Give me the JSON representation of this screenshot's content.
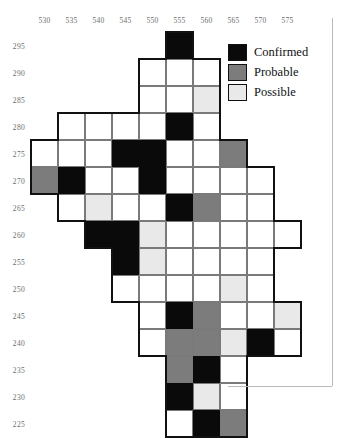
{
  "figure": {
    "type": "case-map-grid",
    "x_axis": {
      "label": "",
      "ticks": [
        530,
        535,
        540,
        545,
        550,
        555,
        560,
        565,
        570,
        575
      ]
    },
    "y_axis": {
      "label": "",
      "ticks": [
        295,
        290,
        285,
        280,
        275,
        270,
        265,
        260,
        255,
        250,
        245,
        240,
        235,
        230,
        225
      ]
    }
  },
  "legend": {
    "position": "top-right",
    "items": [
      {
        "key": "confirmed",
        "label": "Confirmed",
        "color": "#0a0a0a"
      },
      {
        "key": "probable",
        "label": "Probable",
        "color": "#7c7c7c"
      },
      {
        "key": "possible",
        "label": "Possible",
        "color": "#e9e9e9"
      }
    ]
  },
  "chart_data": {
    "type": "heatmap",
    "title": "",
    "xlabel": "",
    "ylabel": "",
    "categories_x": [
      530,
      535,
      540,
      545,
      550,
      555,
      560,
      565,
      570,
      575
    ],
    "categories_y": [
      295,
      290,
      285,
      280,
      275,
      270,
      265,
      260,
      255,
      250,
      245,
      240,
      235,
      230,
      225
    ],
    "value_levels": [
      "none",
      "possible",
      "probable",
      "confirmed"
    ],
    "level_colors": {
      "none": "#ffffff",
      "possible": "#e9e9e9",
      "probable": "#7c7c7c",
      "confirmed": "#0a0a0a"
    },
    "grid": true,
    "legend_position": "top-right",
    "rows": [
      {
        "y": 295,
        "cells": [
          {
            "x": 555,
            "v": "confirmed"
          }
        ]
      },
      {
        "y": 290,
        "cells": [
          {
            "x": 550,
            "v": "none"
          },
          {
            "x": 555,
            "v": "none"
          },
          {
            "x": 560,
            "v": "none"
          }
        ]
      },
      {
        "y": 285,
        "cells": [
          {
            "x": 550,
            "v": "none"
          },
          {
            "x": 555,
            "v": "none"
          },
          {
            "x": 560,
            "v": "possible"
          }
        ]
      },
      {
        "y": 280,
        "cells": [
          {
            "x": 535,
            "v": "none"
          },
          {
            "x": 540,
            "v": "none"
          },
          {
            "x": 545,
            "v": "none"
          },
          {
            "x": 550,
            "v": "none"
          },
          {
            "x": 555,
            "v": "confirmed"
          },
          {
            "x": 560,
            "v": "none"
          }
        ]
      },
      {
        "y": 275,
        "cells": [
          {
            "x": 530,
            "v": "none"
          },
          {
            "x": 535,
            "v": "none"
          },
          {
            "x": 540,
            "v": "none"
          },
          {
            "x": 545,
            "v": "confirmed"
          },
          {
            "x": 550,
            "v": "confirmed"
          },
          {
            "x": 555,
            "v": "none"
          },
          {
            "x": 560,
            "v": "none"
          },
          {
            "x": 565,
            "v": "probable"
          }
        ]
      },
      {
        "y": 270,
        "cells": [
          {
            "x": 530,
            "v": "probable"
          },
          {
            "x": 535,
            "v": "confirmed"
          },
          {
            "x": 540,
            "v": "none"
          },
          {
            "x": 545,
            "v": "none"
          },
          {
            "x": 550,
            "v": "confirmed"
          },
          {
            "x": 555,
            "v": "none"
          },
          {
            "x": 560,
            "v": "none"
          },
          {
            "x": 565,
            "v": "none"
          },
          {
            "x": 570,
            "v": "none"
          }
        ]
      },
      {
        "y": 265,
        "cells": [
          {
            "x": 535,
            "v": "none"
          },
          {
            "x": 540,
            "v": "possible"
          },
          {
            "x": 545,
            "v": "none"
          },
          {
            "x": 550,
            "v": "none"
          },
          {
            "x": 555,
            "v": "confirmed"
          },
          {
            "x": 560,
            "v": "probable"
          },
          {
            "x": 565,
            "v": "none"
          },
          {
            "x": 570,
            "v": "none"
          }
        ]
      },
      {
        "y": 260,
        "cells": [
          {
            "x": 540,
            "v": "confirmed"
          },
          {
            "x": 545,
            "v": "confirmed"
          },
          {
            "x": 550,
            "v": "possible"
          },
          {
            "x": 555,
            "v": "none"
          },
          {
            "x": 560,
            "v": "none"
          },
          {
            "x": 565,
            "v": "none"
          },
          {
            "x": 570,
            "v": "none"
          },
          {
            "x": 575,
            "v": "none"
          }
        ]
      },
      {
        "y": 255,
        "cells": [
          {
            "x": 545,
            "v": "confirmed"
          },
          {
            "x": 550,
            "v": "possible"
          },
          {
            "x": 555,
            "v": "none"
          },
          {
            "x": 560,
            "v": "none"
          },
          {
            "x": 565,
            "v": "none"
          },
          {
            "x": 570,
            "v": "none"
          }
        ]
      },
      {
        "y": 250,
        "cells": [
          {
            "x": 545,
            "v": "none"
          },
          {
            "x": 550,
            "v": "none"
          },
          {
            "x": 555,
            "v": "none"
          },
          {
            "x": 560,
            "v": "none"
          },
          {
            "x": 565,
            "v": "possible"
          },
          {
            "x": 570,
            "v": "none"
          }
        ]
      },
      {
        "y": 245,
        "cells": [
          {
            "x": 550,
            "v": "none"
          },
          {
            "x": 555,
            "v": "confirmed"
          },
          {
            "x": 560,
            "v": "probable"
          },
          {
            "x": 565,
            "v": "none"
          },
          {
            "x": 570,
            "v": "none"
          },
          {
            "x": 575,
            "v": "possible"
          }
        ]
      },
      {
        "y": 240,
        "cells": [
          {
            "x": 550,
            "v": "none"
          },
          {
            "x": 555,
            "v": "probable"
          },
          {
            "x": 560,
            "v": "probable"
          },
          {
            "x": 565,
            "v": "possible"
          },
          {
            "x": 570,
            "v": "confirmed"
          },
          {
            "x": 575,
            "v": "none"
          }
        ]
      },
      {
        "y": 235,
        "cells": [
          {
            "x": 555,
            "v": "probable"
          },
          {
            "x": 560,
            "v": "confirmed"
          },
          {
            "x": 565,
            "v": "none"
          }
        ]
      },
      {
        "y": 230,
        "cells": [
          {
            "x": 555,
            "v": "confirmed"
          },
          {
            "x": 560,
            "v": "possible"
          },
          {
            "x": 565,
            "v": "none"
          }
        ]
      },
      {
        "y": 225,
        "cells": [
          {
            "x": 555,
            "v": "none"
          },
          {
            "x": 560,
            "v": "confirmed"
          },
          {
            "x": 565,
            "v": "probable"
          }
        ]
      }
    ],
    "counts": {
      "confirmed": 14,
      "probable": 9,
      "possible": 8,
      "none": 53
    }
  }
}
